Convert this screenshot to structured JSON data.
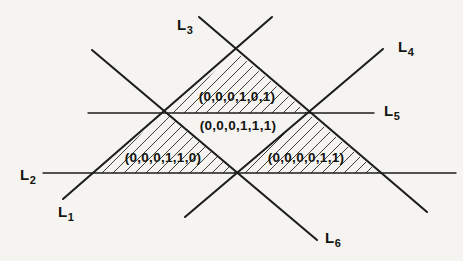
{
  "figure": {
    "width": 463,
    "height": 261,
    "bg_color": "#f5f4f1",
    "line_color": "#1d1d1b",
    "hatch_color": "#3f3e3a",
    "text_color": "#141412",
    "hatch_spacing": 11,
    "diagonal_stroke_width": 2.1,
    "horizontal_stroke_width": 1.4
  },
  "lines": [
    {
      "name": "L1",
      "label": "L",
      "subscript": "1",
      "x1": 63,
      "y1": 199,
      "x2": 272,
      "y2": 17,
      "label_x": 58,
      "label_y": 217
    },
    {
      "name": "L2",
      "label": "L",
      "subscript": "2",
      "x1": 43,
      "y1": 173,
      "x2": 456,
      "y2": 173,
      "label_x": 20,
      "label_y": 180
    },
    {
      "name": "L3",
      "label": "L",
      "subscript": "3",
      "x1": 199,
      "y1": 17,
      "x2": 427,
      "y2": 212,
      "label_x": 177,
      "label_y": 30
    },
    {
      "name": "L4",
      "label": "L",
      "subscript": "4",
      "x1": 185,
      "y1": 217,
      "x2": 383,
      "y2": 49,
      "label_x": 398,
      "label_y": 52
    },
    {
      "name": "L5",
      "label": "L",
      "subscript": "5",
      "x1": 88,
      "y1": 113,
      "x2": 374,
      "y2": 113,
      "label_x": 384,
      "label_y": 116
    },
    {
      "name": "L6",
      "label": "L",
      "subscript": "6",
      "x1": 92,
      "y1": 50,
      "x2": 317,
      "y2": 240,
      "label_x": 325,
      "label_y": 243
    }
  ],
  "regions": [
    {
      "name": "region-upper",
      "label": "(0,0,0,1,0,1)",
      "hatched": true,
      "points": "237,53 166,113 308,113",
      "label_x": 237,
      "label_y": 101
    },
    {
      "name": "region-middle",
      "label": "(0,0,0,1,1,1)",
      "hatched": false,
      "points": "166,113 308,113 237,173",
      "label_x": 238,
      "label_y": 130
    },
    {
      "name": "region-lower-left",
      "label": "(0,0,0,1,1,0)",
      "hatched": true,
      "points": "95,173 166,113 237,173",
      "label_x": 163,
      "label_y": 162
    },
    {
      "name": "region-lower-right",
      "label": "(0,0,0,0,1,1)",
      "hatched": true,
      "points": "237,173 308,113 379,173",
      "label_x": 306,
      "label_y": 162
    }
  ]
}
